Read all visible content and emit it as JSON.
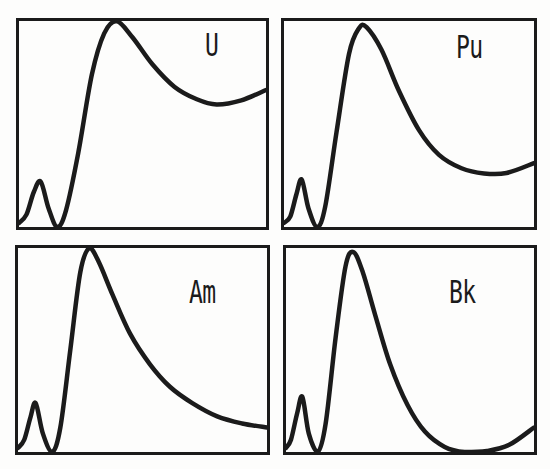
{
  "figure": {
    "background": "#fdfdfc",
    "ink_color": "#1b1b1b",
    "panel_labels": [
      "U",
      "Pu",
      "Am",
      "Bk"
    ]
  },
  "chart_data": [
    {
      "type": "line",
      "label": "U",
      "title": "U",
      "xlabel": "",
      "ylabel": "",
      "xlim": [
        0,
        1
      ],
      "ylim": [
        0,
        1
      ],
      "grid": false,
      "axis_ticks": "none",
      "frame": true,
      "legend": "none",
      "x": [
        0,
        0.03,
        0.06,
        0.088,
        0.12,
        0.155,
        0.19,
        0.24,
        0.295,
        0.345,
        0.395,
        0.46,
        0.54,
        0.63,
        0.72,
        0.8,
        0.9,
        1.0
      ],
      "y": [
        0.02,
        0.06,
        0.17,
        0.22,
        0.09,
        0.0,
        0.08,
        0.36,
        0.74,
        0.94,
        1.0,
        0.92,
        0.79,
        0.68,
        0.62,
        0.595,
        0.615,
        0.665
      ]
    },
    {
      "type": "line",
      "label": "Pu",
      "title": "Pu",
      "xlabel": "",
      "ylabel": "",
      "xlim": [
        0,
        1
      ],
      "ylim": [
        0,
        1
      ],
      "grid": false,
      "axis_ticks": "none",
      "frame": true,
      "legend": "none",
      "x": [
        0,
        0.025,
        0.05,
        0.071,
        0.098,
        0.133,
        0.165,
        0.21,
        0.26,
        0.3,
        0.33,
        0.39,
        0.46,
        0.54,
        0.62,
        0.71,
        0.8,
        0.89,
        1.0
      ],
      "y": [
        0.02,
        0.05,
        0.16,
        0.23,
        0.09,
        0.0,
        0.1,
        0.46,
        0.84,
        0.965,
        0.97,
        0.86,
        0.66,
        0.47,
        0.35,
        0.285,
        0.26,
        0.262,
        0.31
      ]
    },
    {
      "type": "line",
      "label": "Am",
      "title": "Am",
      "xlabel": "",
      "ylabel": "",
      "xlim": [
        0,
        1
      ],
      "ylim": [
        0,
        1
      ],
      "grid": false,
      "axis_ticks": "none",
      "frame": true,
      "legend": "none",
      "x": [
        0,
        0.025,
        0.05,
        0.071,
        0.1,
        0.137,
        0.17,
        0.21,
        0.25,
        0.287,
        0.325,
        0.38,
        0.45,
        0.53,
        0.61,
        0.7,
        0.8,
        0.9,
        1.0
      ],
      "y": [
        0.02,
        0.06,
        0.17,
        0.24,
        0.09,
        0.0,
        0.12,
        0.5,
        0.88,
        1.0,
        0.93,
        0.77,
        0.58,
        0.43,
        0.32,
        0.24,
        0.175,
        0.14,
        0.12
      ]
    },
    {
      "type": "line",
      "label": "Bk",
      "title": "Bk",
      "xlabel": "",
      "ylabel": "",
      "xlim": [
        0,
        1
      ],
      "ylim": [
        0,
        1
      ],
      "grid": false,
      "axis_ticks": "none",
      "frame": true,
      "legend": "none",
      "x": [
        0,
        0.02,
        0.045,
        0.066,
        0.092,
        0.128,
        0.16,
        0.2,
        0.24,
        0.272,
        0.31,
        0.36,
        0.42,
        0.49,
        0.56,
        0.64,
        0.72,
        0.81,
        0.9,
        1.0
      ],
      "y": [
        0.02,
        0.06,
        0.19,
        0.27,
        0.09,
        0.0,
        0.14,
        0.56,
        0.91,
        0.98,
        0.88,
        0.67,
        0.43,
        0.23,
        0.1,
        0.025,
        0.0,
        0.005,
        0.035,
        0.12
      ]
    }
  ]
}
